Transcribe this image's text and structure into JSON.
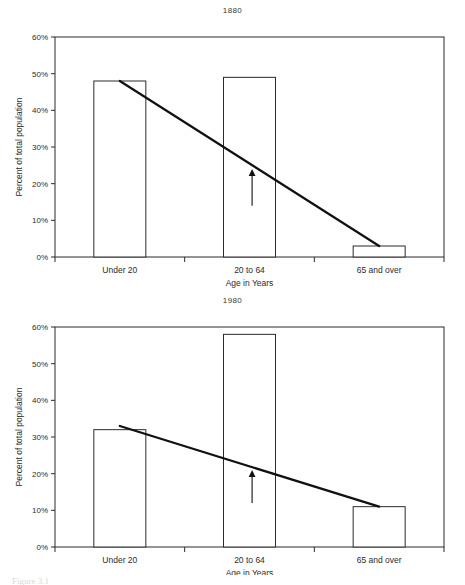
{
  "document": {
    "footnote": "Figure 3.1"
  },
  "charts": [
    {
      "id": "chart-1881",
      "title": "1880",
      "xlabel": "Age in Years",
      "ylabel": "Percent of total population",
      "annotation_icon": "up-arrow-icon"
    },
    {
      "id": "chart-1980",
      "title": "1980",
      "xlabel": "Age in Years",
      "ylabel": "Percent of total  population",
      "annotation_icon": "up-arrow-icon"
    }
  ],
  "chart_data": [
    {
      "type": "bar",
      "title": "1880",
      "xlabel": "Age in Years",
      "ylabel": "Percent of total population",
      "categories": [
        "Under 20",
        "20 to 64",
        "65 and over"
      ],
      "values": [
        48,
        49,
        3
      ],
      "ylim": [
        0,
        60
      ],
      "yticks": [
        0,
        10,
        20,
        30,
        40,
        50,
        60
      ],
      "ytick_labels": [
        "0%",
        "10%",
        "20%",
        "30%",
        "40%",
        "50%",
        "60%"
      ],
      "grid": false,
      "legend": "none",
      "series": [
        {
          "name": "Percent of total population",
          "values": [
            48,
            49,
            3
          ]
        }
      ],
      "annotations": [
        {
          "type": "trendline",
          "label": "declining trend line",
          "from": {
            "x": 0,
            "y": 48
          },
          "to": {
            "x": 2,
            "y": 3
          }
        },
        {
          "type": "arrow",
          "label": "up-arrow pointing at trend line",
          "x": 1.02,
          "y_from": 14,
          "y_to": 24
        }
      ]
    },
    {
      "type": "bar",
      "title": "1980",
      "xlabel": "Age in Years",
      "ylabel": "Percent of total  population",
      "categories": [
        "Under 20",
        "20 to 64",
        "65 and over"
      ],
      "values": [
        32,
        58,
        11
      ],
      "ylim": [
        0,
        60
      ],
      "yticks": [
        0,
        10,
        20,
        30,
        40,
        50,
        60
      ],
      "ytick_labels": [
        "0%",
        "10%",
        "20%",
        "30%",
        "40%",
        "50%",
        "60%"
      ],
      "grid": false,
      "legend": "none",
      "series": [
        {
          "name": "Percent of total population",
          "values": [
            32,
            58,
            11
          ]
        }
      ],
      "annotations": [
        {
          "type": "trendline",
          "label": "declining trend line",
          "from": {
            "x": 0,
            "y": 33
          },
          "to": {
            "x": 2,
            "y": 11
          }
        },
        {
          "type": "arrow",
          "label": "up-arrow pointing at trend line",
          "x": 1.02,
          "y_from": 12,
          "y_to": 21
        }
      ]
    }
  ]
}
